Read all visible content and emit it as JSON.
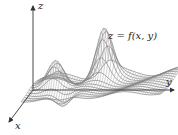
{
  "figure": {
    "type": "3d-surface-plot",
    "equation_label": "z = f(x, y)",
    "axes": {
      "x": {
        "label": "x"
      },
      "y": {
        "label": "y"
      },
      "z": {
        "label": "z"
      }
    },
    "colors": {
      "axis": "#333333",
      "mesh": "#555555",
      "mesh_light": "#9a9a9a",
      "background": "#ffffff"
    }
  }
}
